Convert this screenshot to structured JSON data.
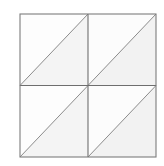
{
  "figure": {
    "type": "geometry-diagram",
    "background_color": "#ffffff",
    "canvas": {
      "width": 164,
      "height": 166
    }
  },
  "mesh": {
    "outline": {
      "x": 20,
      "y": 14,
      "width": 136,
      "height": 143,
      "stroke_color": "#7d7d7d",
      "stroke_width": 1.1,
      "fill_color": "#f8f8f8"
    },
    "grid": {
      "rows": 2,
      "cols": 2,
      "cell_width": 68,
      "cell_height": 71.5,
      "divider_color": "#6e6e6e",
      "divider_width": 1.1,
      "vertical_divider_x": 88,
      "horizontal_divider_y": 85.5
    },
    "diagonal": {
      "direction": "bottom-left-to-top-right",
      "symbol": "/",
      "stroke_color": "#8c8c8c",
      "stroke_width": 1.0,
      "count": 4
    },
    "cells": [
      {
        "id": "cell-r0-c0",
        "row": 0,
        "col": 0,
        "x": 20,
        "y": 14,
        "upper_triangle_fill": "#fdfdfd",
        "lower_triangle_fill": "#f4f4f4"
      },
      {
        "id": "cell-r0-c1",
        "row": 0,
        "col": 1,
        "x": 88,
        "y": 14,
        "upper_triangle_fill": "#fcfcfc",
        "lower_triangle_fill": "#f2f2f2"
      },
      {
        "id": "cell-r1-c0",
        "row": 1,
        "col": 0,
        "x": 20,
        "y": 85.5,
        "upper_triangle_fill": "#fdfdfd",
        "lower_triangle_fill": "#f4f4f4"
      },
      {
        "id": "cell-r1-c1",
        "row": 1,
        "col": 1,
        "x": 88,
        "y": 85.5,
        "upper_triangle_fill": "#fcfcfc",
        "lower_triangle_fill": "#f2f2f2"
      }
    ],
    "triangle_count": 8,
    "vertex_count": 9
  }
}
